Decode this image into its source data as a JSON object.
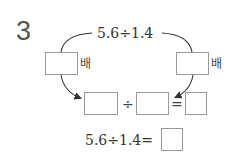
{
  "problem": {
    "number": "3",
    "top_expression": "5.6÷1.4",
    "left_multiplier_unit": "배",
    "right_multiplier_unit": "배",
    "middle_row": {
      "divide_symbol": "÷",
      "equals_symbol": "="
    },
    "bottom_expression": "5.6÷1.4=",
    "answer_boxes": {
      "left_multiplier": "",
      "right_multiplier": "",
      "dividend": "",
      "divisor": "",
      "quotient": "",
      "final_answer": ""
    }
  }
}
